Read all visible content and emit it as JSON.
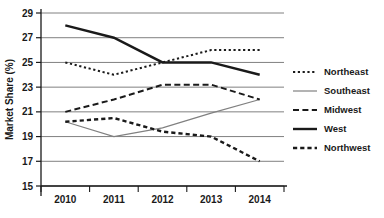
{
  "chart_data": {
    "type": "line",
    "title": "",
    "xlabel": "",
    "ylabel": "Market Share (%)",
    "categories": [
      "2010",
      "2011",
      "2012",
      "2013",
      "2014"
    ],
    "ylim": [
      15,
      29
    ],
    "yticks": [
      15,
      17,
      19,
      21,
      23,
      25,
      27,
      29
    ],
    "grid": true,
    "legend_position": "right",
    "series": [
      {
        "name": "Northeast",
        "style": "dotted",
        "color": "#1a1a1a",
        "values": [
          25,
          24,
          25,
          26,
          26
        ]
      },
      {
        "name": "Southeast",
        "style": "solid-thin",
        "color": "#808080",
        "values": [
          20.2,
          19,
          19.7,
          20.9,
          22
        ]
      },
      {
        "name": "Midwest",
        "style": "dashed",
        "color": "#1a1a1a",
        "values": [
          21,
          22,
          23.2,
          23.2,
          22
        ]
      },
      {
        "name": "West",
        "style": "solid-thick",
        "color": "#1a1a1a",
        "values": [
          28,
          27,
          25,
          25,
          24
        ]
      },
      {
        "name": "Northwest",
        "style": "dash-short",
        "color": "#1a1a1a",
        "values": [
          20.2,
          20.5,
          19.4,
          19,
          17
        ]
      }
    ]
  },
  "axes": {
    "y_tick_labels": [
      "29",
      "27",
      "25",
      "23",
      "21",
      "19",
      "17",
      "15"
    ],
    "x_tick_labels": [
      "2010",
      "2011",
      "2012",
      "2013",
      "2014"
    ],
    "y_axis_title": "Market Share (%)"
  },
  "legend": {
    "items": [
      {
        "label": "Northeast"
      },
      {
        "label": "Southeast"
      },
      {
        "label": "Midwest"
      },
      {
        "label": "West"
      },
      {
        "label": "Northwest"
      }
    ]
  },
  "colors": {
    "ink": "#1a1a1a",
    "grid": "#808080",
    "southeast": "#808080",
    "background": "#ffffff"
  }
}
